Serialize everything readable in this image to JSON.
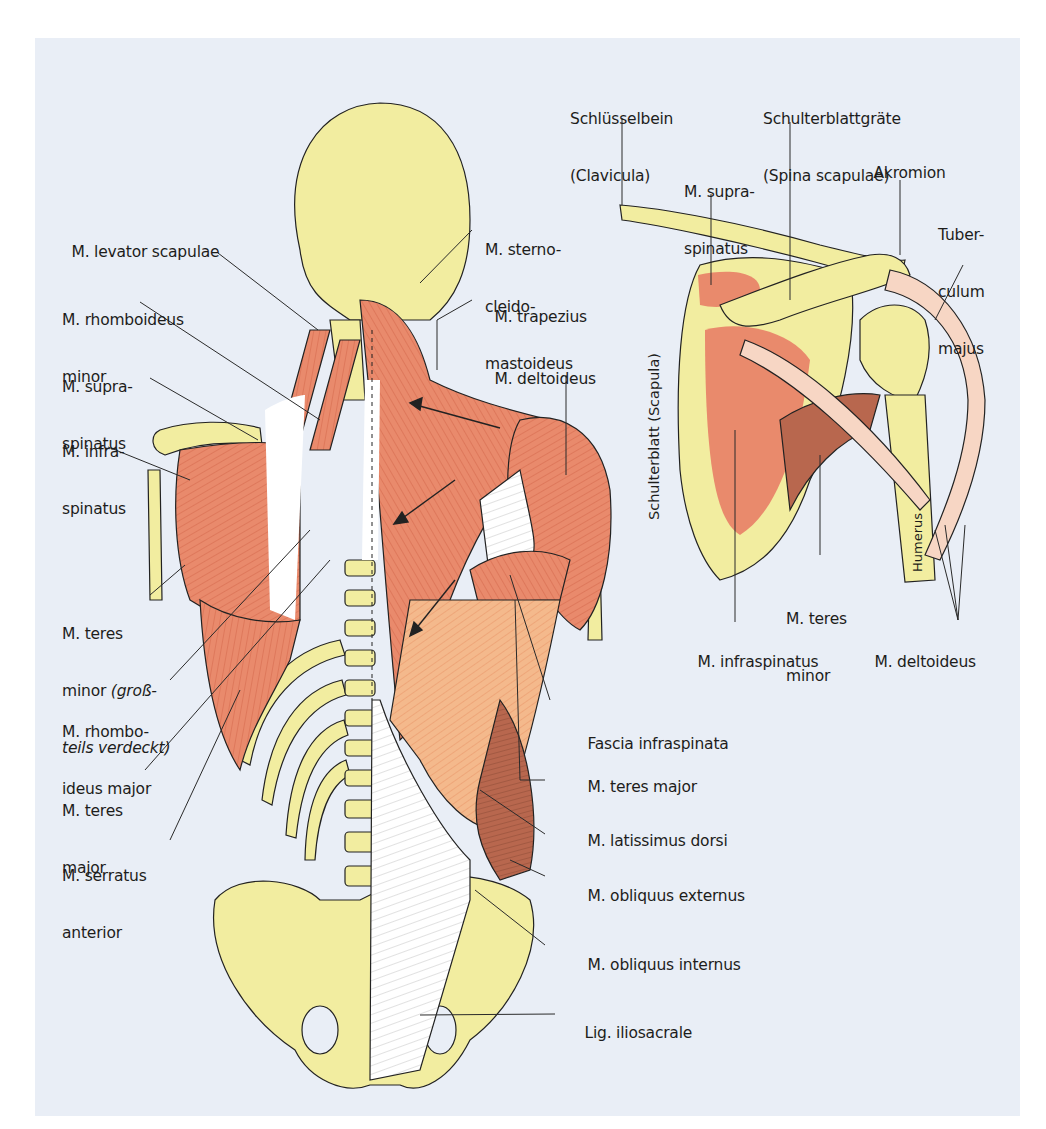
{
  "figure": {
    "colors": {
      "background": "#e9eef6",
      "bone": "#f2eda0",
      "muscle": "#e98a6c",
      "muscle_light": "#f4b98c",
      "muscle_dark": "#b8674e",
      "tendon": "#f7d6c4",
      "line": "#222222"
    },
    "left_illustration": {
      "title": "Back muscles, posterior view",
      "labels_left": [
        {
          "id": "levator-scapulae",
          "lines": [
            "M. levator scapulae"
          ]
        },
        {
          "id": "rhomboideus-minor",
          "lines": [
            "M. rhomboideus",
            "minor"
          ]
        },
        {
          "id": "supraspinatus",
          "lines": [
            "M. supra-",
            "spinatus"
          ]
        },
        {
          "id": "infraspinatus",
          "lines": [
            "M. infra-",
            "spinatus"
          ]
        },
        {
          "id": "teres-minor",
          "lines": [
            "M. teres",
            "minor"
          ],
          "italic_note": [
            "(groß-",
            "teils verdeckt)"
          ]
        },
        {
          "id": "rhomboideus-major",
          "lines": [
            "M. rhombo-",
            "ideus major"
          ]
        },
        {
          "id": "teres-major",
          "lines": [
            "M. teres",
            "major"
          ]
        },
        {
          "id": "serratus-anterior",
          "lines": [
            "M. serratus",
            "anterior"
          ]
        }
      ],
      "labels_right": [
        {
          "id": "sternocleidomastoideus",
          "lines": [
            "M. sterno-",
            "cleido-",
            "mastoideus"
          ]
        },
        {
          "id": "trapezius",
          "lines": [
            "M. trapezius"
          ]
        },
        {
          "id": "deltoideus",
          "lines": [
            "M. deltoideus"
          ]
        },
        {
          "id": "fascia-infraspinata",
          "lines": [
            "Fascia infraspinata"
          ]
        },
        {
          "id": "teres-major-r",
          "lines": [
            "M. teres major"
          ]
        },
        {
          "id": "latissimus-dorsi",
          "lines": [
            "M. latissimus dorsi"
          ]
        },
        {
          "id": "obliquus-externus",
          "lines": [
            "M. obliquus externus"
          ]
        },
        {
          "id": "obliquus-internus",
          "lines": [
            "M. obliquus internus"
          ]
        },
        {
          "id": "lig-iliosacrale",
          "lines": [
            "Lig. iliosacrale"
          ]
        }
      ]
    },
    "right_illustration": {
      "title": "Shoulder blade detail",
      "labels": [
        {
          "id": "clavicula",
          "lines": [
            "Schlüsselbein",
            "(Clavicula)"
          ]
        },
        {
          "id": "spina-scapulae",
          "lines": [
            "Schulterblattgräte",
            "(Spina scapulae)"
          ]
        },
        {
          "id": "supraspinatus-r",
          "lines": [
            "M. supra-",
            "spinatus"
          ]
        },
        {
          "id": "akromion",
          "lines": [
            "Akromion"
          ]
        },
        {
          "id": "tuberculum",
          "lines": [
            "Tuber-",
            "culum",
            "majus"
          ]
        },
        {
          "id": "teres-minor-r",
          "lines": [
            "M. teres",
            "minor"
          ]
        },
        {
          "id": "infraspinatus-r",
          "lines": [
            "M. infraspinatus"
          ]
        },
        {
          "id": "deltoideus-r",
          "lines": [
            "M. deltoideus"
          ]
        }
      ],
      "vertical_labels": {
        "scapula": "Schulterblatt (Scapula)",
        "humerus": "Humerus"
      }
    }
  }
}
